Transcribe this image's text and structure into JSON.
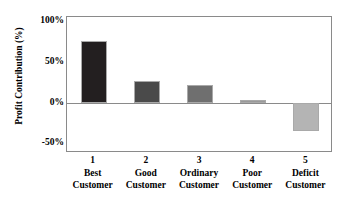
{
  "chart_data": {
    "type": "bar",
    "title": "",
    "subtitle": "",
    "xlabel": "",
    "ylabel": "Profit Contribution (%)",
    "categories": [
      "1",
      "2",
      "3",
      "4",
      "5"
    ],
    "category_lines": [
      [
        "Best",
        "Customer"
      ],
      [
        "Good",
        "Customer"
      ],
      [
        "Ordinary",
        "Customer"
      ],
      [
        "Poor",
        "Customer"
      ],
      [
        "Deficit",
        "Customer"
      ]
    ],
    "values": [
      76,
      27,
      21,
      2,
      -35
    ],
    "value_unit": "%",
    "ylim": [
      -62,
      105
    ],
    "yticks": [
      100,
      50,
      0,
      -50
    ],
    "ytick_labels": [
      "100%",
      "50%",
      "0%",
      "-50%"
    ],
    "grid": false,
    "legend": "none",
    "zero_line": true,
    "bar_colors": [
      "#231f20",
      "#4a4a4a",
      "#6f6f6f",
      "#9a9a9a",
      "#b4b4b4"
    ],
    "bar_border_color": "#a9a9a9",
    "frame_color": "#8a8a8a",
    "background": "#ffffff",
    "text_color": "#000000"
  },
  "chart": {
    "y_axis_title": "Profit Contribution (%)",
    "y_ticks": [
      {
        "label": "100%",
        "value": 100
      },
      {
        "label": "50%",
        "value": 50
      },
      {
        "label": "0%",
        "value": 0
      },
      {
        "label": "-50%",
        "value": -50
      }
    ],
    "bars": [
      {
        "number": "1",
        "line1": "Best",
        "line2": "Customer",
        "value": 76,
        "color": "#231f20"
      },
      {
        "number": "2",
        "line1": "Good",
        "line2": "Customer",
        "value": 27,
        "color": "#4a4a4a"
      },
      {
        "number": "3",
        "line1": "Ordinary",
        "line2": "Customer",
        "value": 21,
        "color": "#6f6f6f"
      },
      {
        "number": "4",
        "line1": "Poor",
        "line2": "Customer",
        "value": 2,
        "color": "#9a9a9a"
      },
      {
        "number": "5",
        "line1": "Deficit",
        "line2": "Customer",
        "value": -35,
        "color": "#b4b4b4"
      }
    ]
  }
}
